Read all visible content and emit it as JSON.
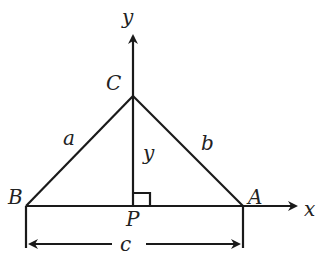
{
  "diagram": {
    "type": "triangle-with-altitude",
    "labels": {
      "y_axis": "y",
      "x_axis": "x",
      "vertex_c": "C",
      "vertex_b": "B",
      "vertex_a": "A",
      "foot_p": "P",
      "side_a": "a",
      "side_b": "b",
      "altitude": "y",
      "base": "c"
    },
    "colors": {
      "stroke": "#1a1a1a",
      "background": "#ffffff"
    }
  }
}
